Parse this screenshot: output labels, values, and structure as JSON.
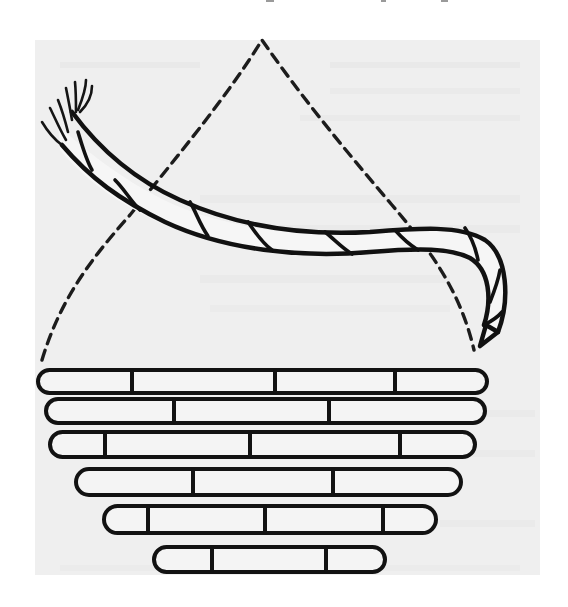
{
  "figure": {
    "colors": {
      "paper": "#ffffff",
      "print_area": "#efefef",
      "ink": "#111111"
    },
    "print_area": {
      "x": 35,
      "y": 40,
      "width": 505,
      "height": 535
    },
    "dashed_trajectory": {
      "apex": {
        "x": 262,
        "y": 40
      },
      "left_end": {
        "x": 42,
        "y": 360
      },
      "right_end": {
        "x": 474,
        "y": 350
      }
    },
    "rope": {
      "frayed_end": {
        "x": 55,
        "y": 115
      },
      "hook_end": {
        "x": 485,
        "y": 350
      }
    },
    "coil_stack": {
      "rows": [
        {
          "label": "coil-row-1",
          "x1": 38,
          "x2": 487,
          "y": 370,
          "h": 23,
          "dividers": [
            132,
            275,
            395
          ]
        },
        {
          "label": "coil-row-2",
          "x1": 46,
          "x2": 485,
          "y": 399,
          "h": 24,
          "dividers": [
            174,
            329
          ]
        },
        {
          "label": "coil-row-3",
          "x1": 50,
          "x2": 475,
          "y": 432,
          "h": 25,
          "dividers": [
            105,
            250,
            400
          ]
        },
        {
          "label": "coil-row-4",
          "x1": 76,
          "x2": 461,
          "y": 469,
          "h": 26,
          "dividers": [
            193,
            333
          ]
        },
        {
          "label": "coil-row-5",
          "x1": 104,
          "x2": 436,
          "y": 506,
          "h": 27,
          "dividers": [
            148,
            265,
            383
          ]
        },
        {
          "label": "coil-row-6",
          "x1": 154,
          "x2": 385,
          "y": 547,
          "h": 25,
          "dividers": [
            212,
            326
          ]
        }
      ]
    }
  }
}
